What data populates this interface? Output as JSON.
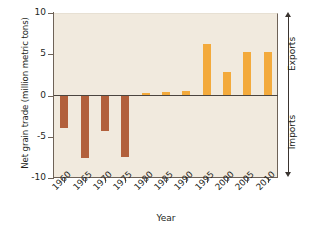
{
  "chart_data": {
    "type": "bar",
    "title": "",
    "xlabel": "Year",
    "ylabel": "Net grain trade (million metric tons)",
    "categories": [
      "1960",
      "1965",
      "1970",
      "1975",
      "1980",
      "1985",
      "1990",
      "1995",
      "2000",
      "2005",
      "2010"
    ],
    "values": [
      -3.9,
      -7.6,
      -4.3,
      -7.5,
      0.25,
      0.4,
      0.5,
      6.3,
      2.8,
      5.3,
      5.3
    ],
    "ylim": [
      -10,
      10
    ],
    "yticks": [
      10,
      5,
      0,
      -5,
      -10
    ],
    "ytick_labels": [
      "10",
      "5",
      "0",
      "-5",
      "-10"
    ],
    "grid": false,
    "legend": "none",
    "series_name": "Net grain trade",
    "positive_color": "#f3aa3c",
    "negative_color": "#b2603c",
    "plot_background": "#f1eade",
    "annotations": [
      {
        "name": "exports",
        "text": "Exports",
        "arrow": "up",
        "position": "right-upper"
      },
      {
        "name": "imports",
        "text": "Imports",
        "arrow": "down",
        "position": "right-lower"
      }
    ]
  },
  "axis": {
    "y_title": "Net grain trade (million metric tons)",
    "x_title": "Year"
  },
  "side": {
    "exports_label": "Exports",
    "imports_label": "Imports"
  }
}
